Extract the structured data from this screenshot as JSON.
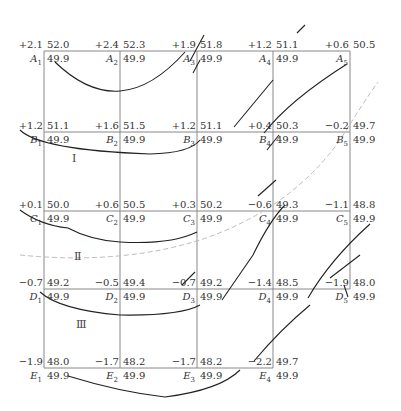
{
  "grid": {
    "columns_x": [
      44,
      120,
      197,
      273,
      350
    ],
    "rows_y": [
      51,
      132,
      211,
      289,
      368
    ],
    "line_color": "#888888"
  },
  "points": [
    {
      "name": "A",
      "idx": "1",
      "row": 0,
      "col": 0,
      "delta": "+2.1",
      "top": "52.0",
      "bottom": "49.9"
    },
    {
      "name": "A",
      "idx": "2",
      "row": 0,
      "col": 1,
      "delta": "+2.4",
      "top": "52.3",
      "bottom": "49.9"
    },
    {
      "name": "A",
      "idx": "3",
      "row": 0,
      "col": 2,
      "delta": "+1.9",
      "top": "51.8",
      "bottom": "49.9"
    },
    {
      "name": "A",
      "idx": "4",
      "row": 0,
      "col": 3,
      "delta": "+1.2",
      "top": "51.1",
      "bottom": "49.9"
    },
    {
      "name": "A",
      "idx": "5",
      "row": 0,
      "col": 4,
      "delta": "+0.6",
      "top": "50.5",
      "bottom": ""
    },
    {
      "name": "B",
      "idx": "1",
      "row": 1,
      "col": 0,
      "delta": "+1.2",
      "top": "51.1",
      "bottom": "49.9"
    },
    {
      "name": "B",
      "idx": "2",
      "row": 1,
      "col": 1,
      "delta": "+1.6",
      "top": "51.5",
      "bottom": "49.9"
    },
    {
      "name": "B",
      "idx": "3",
      "row": 1,
      "col": 2,
      "delta": "+1.2",
      "top": "51.1",
      "bottom": "49.9"
    },
    {
      "name": "B",
      "idx": "4",
      "row": 1,
      "col": 3,
      "delta": "+0.4",
      "top": "50.3",
      "bottom": "49.9"
    },
    {
      "name": "B",
      "idx": "5",
      "row": 1,
      "col": 4,
      "delta": "−0.2",
      "top": "49.7",
      "bottom": "49.9"
    },
    {
      "name": "C",
      "idx": "1",
      "row": 2,
      "col": 0,
      "delta": "+0.1",
      "top": "50.0",
      "bottom": "49.9"
    },
    {
      "name": "C",
      "idx": "2",
      "row": 2,
      "col": 1,
      "delta": "+0.6",
      "top": "50.5",
      "bottom": "49.9"
    },
    {
      "name": "C",
      "idx": "3",
      "row": 2,
      "col": 2,
      "delta": "+0.3",
      "top": "50.2",
      "bottom": "49.9"
    },
    {
      "name": "C",
      "idx": "4",
      "row": 2,
      "col": 3,
      "delta": "−0.6",
      "top": "49.3",
      "bottom": "49.9"
    },
    {
      "name": "C",
      "idx": "5",
      "row": 2,
      "col": 4,
      "delta": "−1.1",
      "top": "48.8",
      "bottom": "49.9"
    },
    {
      "name": "D",
      "idx": "1",
      "row": 3,
      "col": 0,
      "delta": "−0.7",
      "top": "49.2",
      "bottom": "49.9"
    },
    {
      "name": "D",
      "idx": "2",
      "row": 3,
      "col": 1,
      "delta": "−0.5",
      "top": "49.4",
      "bottom": "49.9"
    },
    {
      "name": "D",
      "idx": "3",
      "row": 3,
      "col": 2,
      "delta": "−0.7",
      "top": "49.2",
      "bottom": "49.9"
    },
    {
      "name": "D",
      "idx": "4",
      "row": 3,
      "col": 3,
      "delta": "−1.4",
      "top": "48.5",
      "bottom": "49.9"
    },
    {
      "name": "D",
      "idx": "5",
      "row": 3,
      "col": 4,
      "delta": "−1.9",
      "top": "48.0",
      "bottom": "49.9"
    },
    {
      "name": "E",
      "idx": "1",
      "row": 4,
      "col": 0,
      "delta": "−1.9",
      "top": "48.0",
      "bottom": "49.9"
    },
    {
      "name": "E",
      "idx": "2",
      "row": 4,
      "col": 1,
      "delta": "−1.7",
      "top": "48.2",
      "bottom": "49.9"
    },
    {
      "name": "E",
      "idx": "3",
      "row": 4,
      "col": 2,
      "delta": "−1.7",
      "top": "48.2",
      "bottom": "49.9"
    },
    {
      "name": "E",
      "idx": "4",
      "row": 4,
      "col": 3,
      "delta": "−2.2",
      "top": "49.7",
      "bottom": "49.9"
    }
  ],
  "regions": [
    {
      "label": "Ⅰ",
      "x": 72,
      "y": 152
    },
    {
      "label": "Ⅱ",
      "x": 74,
      "y": 250
    },
    {
      "label": "Ⅲ",
      "x": 76,
      "y": 318
    }
  ],
  "curves": {
    "solid": [
      "M55,62 Q120,125 185,52",
      "M20,130 Q40,150 150,154 Q190,153 200,140",
      "M20,210 Q40,225 68,228 Q90,240 120,242 Q170,245 197,232",
      "M40,292 Q60,310 120,315 Q180,316 200,305",
      "M68,376 Q120,392 165,397 Q220,390 240,370",
      "M190,61 L204,35",
      "M193,73 L200,60",
      "M297,33 L305,25",
      "M234,127 L273,80",
      "M264,133 Q290,100 347,64",
      "M258,196 L276,180",
      "M267,150 L279,135",
      "M222,300 L253,255 Q270,220 285,205",
      "M308,298 Q330,260 370,224",
      "M254,361 Q280,330 310,305",
      "M330,278 L360,255",
      "M344,285 L348,297",
      "M182,285 L195,272"
    ],
    "dashed": [
      "M20,255 Q120,265 200,240 Q290,210 340,140 Q365,100 378,82"
    ],
    "solid_color": "#222222",
    "dashed_color": "#bbbbbb"
  }
}
